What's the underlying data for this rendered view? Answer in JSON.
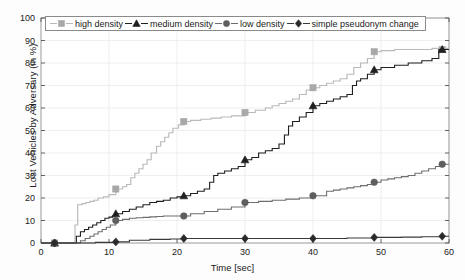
{
  "chart_data": {
    "type": "line",
    "title": "",
    "xlabel": "Time [sec]",
    "ylabel": "Lost Vehicles by Adversary (in %)",
    "xlim": [
      0,
      60
    ],
    "ylim": [
      0,
      100
    ],
    "xticks": [
      0,
      10,
      20,
      30,
      40,
      50,
      60
    ],
    "yticks": [
      0,
      10,
      20,
      30,
      40,
      50,
      60,
      70,
      80,
      90,
      100
    ],
    "grid": true,
    "legend_position": "top-center",
    "markers_at_x": [
      2,
      11,
      21,
      30,
      40,
      49,
      59
    ],
    "series": [
      {
        "name": "high density",
        "color": "#b9b9b9",
        "marker": "square",
        "marker_color": "#a8a8a8",
        "marker_values": [
          0,
          24,
          54,
          58,
          69,
          85,
          86
        ],
        "x": [
          0,
          2,
          4.6,
          5.0,
          5.4,
          6.0,
          6.6,
          7.2,
          7.8,
          8.4,
          9.2,
          10.0,
          11.0,
          12.0,
          12.6,
          13.2,
          13.8,
          14.4,
          15.0,
          15.6,
          16.2,
          17.0,
          17.6,
          18.2,
          18.8,
          19.4,
          20.2,
          21.0,
          22.0,
          23.5,
          25.0,
          26.5,
          28.0,
          30.0,
          31.5,
          33.0,
          34.0,
          35.0,
          36.0,
          37.0,
          38.0,
          39.0,
          40.0,
          41.0,
          42.0,
          43.0,
          44.0,
          45.0,
          46.0,
          47.0,
          48.0,
          49.0,
          50.0,
          52.0,
          54.0,
          56.0,
          57.5,
          58.5,
          60.0
        ],
        "y": [
          0,
          0,
          0,
          8,
          17,
          17.5,
          18,
          18.5,
          19,
          20,
          20.5,
          21.5,
          24,
          25,
          26,
          29,
          31,
          33,
          35,
          37,
          40,
          43,
          45,
          47,
          49,
          51,
          52.5,
          54,
          54.5,
          55,
          55.5,
          56,
          56.5,
          58,
          59,
          60,
          61,
          62,
          63,
          64,
          66,
          68,
          69,
          70,
          71,
          72,
          73,
          75,
          78,
          80,
          82,
          85,
          85.5,
          86,
          86,
          86,
          86.5,
          86.5,
          86.5
        ]
      },
      {
        "name": "medium density",
        "color": "#1f1f1f",
        "marker": "triangle",
        "marker_color": "#1f1f1f",
        "marker_values": [
          0,
          13,
          21,
          37,
          61,
          77,
          86
        ],
        "x": [
          0,
          2,
          4.8,
          5.2,
          5.8,
          6.4,
          7.0,
          7.6,
          8.2,
          8.8,
          9.4,
          10.0,
          10.5,
          11.0,
          12.0,
          13.0,
          14.0,
          15.0,
          16.0,
          17.0,
          18.0,
          19.0,
          20.0,
          21.0,
          22.0,
          23.0,
          24.0,
          24.8,
          25.4,
          26.0,
          27.0,
          28.0,
          29.0,
          30.0,
          31.0,
          32.0,
          33.0,
          34.0,
          35.0,
          35.8,
          36.4,
          37.0,
          38.0,
          39.0,
          40.0,
          41.0,
          42.0,
          43.0,
          44.0,
          45.0,
          45.8,
          46.4,
          47.0,
          48.0,
          49.0,
          50.0,
          52.0,
          54.0,
          56.0,
          57.5,
          58.5,
          60.0
        ],
        "y": [
          0,
          0,
          0,
          3,
          5,
          6,
          7,
          8,
          9,
          10,
          11,
          11.5,
          12,
          13,
          14,
          15,
          16,
          17,
          18,
          18.5,
          19,
          20,
          20.5,
          21,
          22,
          23,
          24,
          27,
          30,
          31,
          32,
          33,
          34,
          37,
          38,
          40,
          41,
          42,
          44,
          48,
          52,
          54,
          56,
          58,
          61,
          62,
          63,
          64,
          65,
          66,
          70,
          72,
          73,
          75,
          77,
          78,
          79,
          80,
          81,
          82,
          86,
          86
        ]
      },
      {
        "name": "low density",
        "color": "#6e6e6e",
        "marker": "circle",
        "marker_color": "#5e5e5e",
        "marker_values": [
          0,
          10,
          12,
          18,
          21,
          27,
          35
        ],
        "x": [
          0,
          2,
          5.2,
          5.8,
          6.5,
          7.2,
          7.8,
          8.4,
          9.0,
          9.6,
          10.2,
          11.0,
          12.0,
          13.0,
          14.0,
          15.0,
          16.0,
          17.0,
          18.0,
          19.0,
          20.0,
          21.0,
          22.0,
          24.0,
          26.0,
          28.0,
          30.0,
          32.0,
          34.0,
          36.0,
          38.0,
          40.0,
          41.5,
          42.0,
          43.0,
          44.0,
          45.0,
          46.0,
          47.0,
          48.0,
          49.0,
          50.0,
          51.0,
          52.0,
          53.0,
          54.0,
          55.0,
          56.0,
          57.0,
          58.0,
          59.0,
          60.0
        ],
        "y": [
          0,
          0,
          0,
          1,
          2,
          3,
          4,
          5,
          6,
          7,
          8,
          10,
          10.5,
          11,
          11.2,
          11.4,
          11.6,
          11.8,
          12,
          12,
          12,
          12,
          13,
          14,
          15,
          16,
          18,
          18.5,
          19,
          19.5,
          20,
          21,
          21,
          23,
          23.5,
          24,
          24.5,
          25,
          25.5,
          26,
          27,
          28,
          28.5,
          29,
          29.5,
          30,
          31,
          32,
          33,
          34,
          35,
          35
        ]
      },
      {
        "name": "simple pseudonym change",
        "color": "#3a3a3a",
        "marker": "diamond",
        "marker_color": "#2a2a2a",
        "marker_values": [
          0,
          0.5,
          2,
          2,
          2,
          2.5,
          3
        ],
        "x": [
          0,
          2,
          5,
          8,
          11,
          13,
          16,
          19,
          21,
          25,
          30,
          35,
          40,
          45,
          49,
          53,
          56,
          59,
          60
        ],
        "y": [
          0,
          0,
          0,
          0.3,
          0.5,
          1.2,
          1.6,
          1.8,
          2,
          2,
          2,
          2,
          2,
          2.2,
          2.5,
          2.6,
          2.8,
          3,
          3
        ]
      }
    ]
  },
  "legend": {
    "items": [
      {
        "label": "high density"
      },
      {
        "label": "medium density"
      },
      {
        "label": "low density"
      },
      {
        "label": "simple pseudonym change"
      }
    ]
  }
}
